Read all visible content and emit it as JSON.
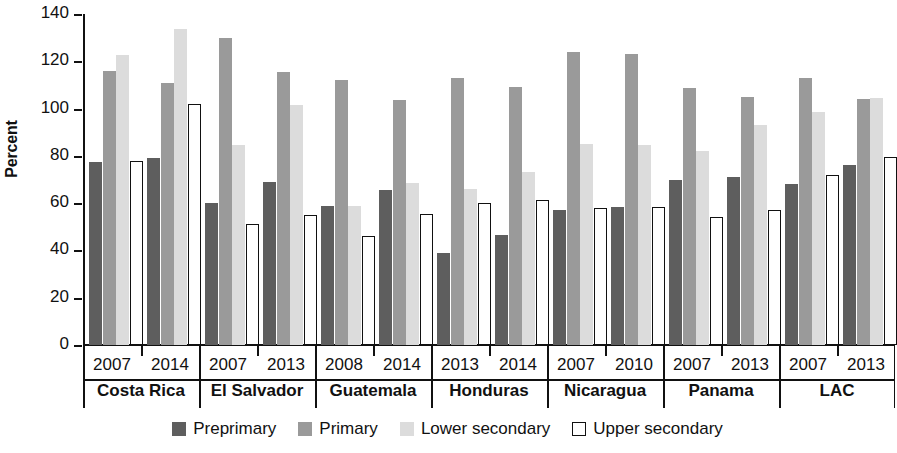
{
  "chart_data": {
    "type": "bar",
    "title": "",
    "xlabel": "",
    "ylabel": "Percent",
    "ylim": [
      0,
      140
    ],
    "yticks": [
      0,
      20,
      40,
      60,
      80,
      100,
      120,
      140
    ],
    "grid": false,
    "legend_position": "bottom",
    "series": [
      {
        "name": "Preprimary",
        "color": "#5e5e5e"
      },
      {
        "name": "Primary",
        "color": "#9a9a9a"
      },
      {
        "name": "Lower secondary",
        "color": "#dcdcdc"
      },
      {
        "name": "Upper secondary",
        "color": "#ffffff"
      }
    ],
    "groups": [
      {
        "label": "Costa Rica",
        "years": [
          {
            "year": "2007",
            "values": [
              77.5,
              116.0,
              122.5,
              78.0
            ]
          },
          {
            "year": "2014",
            "values": [
              79.0,
              111.0,
              133.5,
              102.0
            ]
          }
        ]
      },
      {
        "label": "El Salvador",
        "years": [
          {
            "year": "2007",
            "values": [
              60.0,
              130.0,
              84.5,
              51.0
            ]
          },
          {
            "year": "2013",
            "values": [
              69.0,
              115.5,
              101.5,
              55.0
            ]
          }
        ]
      },
      {
        "label": "Guatemala",
        "years": [
          {
            "year": "2008",
            "values": [
              59.0,
              112.0,
              59.0,
              46.0
            ]
          },
          {
            "year": "2014",
            "values": [
              65.5,
              103.5,
              68.5,
              55.5
            ]
          }
        ]
      },
      {
        "label": "Honduras",
        "years": [
          {
            "year": "2013",
            "values": [
              39.0,
              113.0,
              66.0,
              60.0
            ]
          },
          {
            "year": "2014",
            "values": [
              46.5,
              109.0,
              73.0,
              61.5
            ]
          }
        ]
      },
      {
        "label": "Nicaragua",
        "years": [
          {
            "year": "2007",
            "values": [
              57.0,
              124.0,
              85.0,
              58.0
            ]
          },
          {
            "year": "2010",
            "values": [
              58.5,
              123.0,
              84.5,
              58.5
            ]
          }
        ]
      },
      {
        "label": "Panama",
        "years": [
          {
            "year": "2007",
            "values": [
              70.0,
              108.5,
              82.0,
              54.0
            ]
          },
          {
            "year": "2013",
            "values": [
              71.0,
              105.0,
              93.0,
              57.0
            ]
          }
        ]
      },
      {
        "label": "LAC",
        "years": [
          {
            "year": "2007",
            "values": [
              68.0,
              113.0,
              98.5,
              72.0
            ]
          },
          {
            "year": "2013",
            "values": [
              76.0,
              104.0,
              104.5,
              79.5
            ]
          }
        ]
      }
    ]
  }
}
